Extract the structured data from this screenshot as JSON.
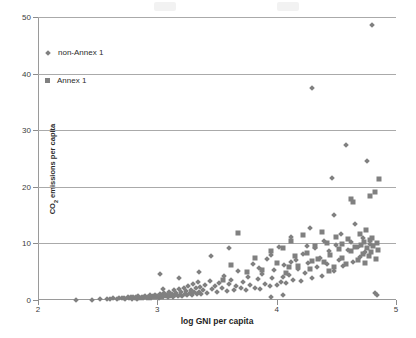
{
  "chart_data": {
    "type": "scatter",
    "title": "",
    "xlabel": "log GNI per capita",
    "ylabel": "CO₂ emissions per capita",
    "xlim": [
      2,
      5
    ],
    "ylim": [
      0,
      50
    ],
    "xticks": [
      "2",
      "3",
      "4",
      "5"
    ],
    "xtick_values": [
      2,
      3,
      4,
      5
    ],
    "yticks": [
      "0",
      "10",
      "20",
      "30",
      "40",
      "50"
    ],
    "ytick_values": [
      0,
      10,
      20,
      30,
      40,
      50
    ],
    "grid": "horizontal",
    "legend_position": "upper-left-inside",
    "marker_color": "#808080",
    "grid_color": "#aaaaaa",
    "axis_color": "#9a9a9a",
    "legend": [
      {
        "label": "non-Annex 1",
        "marker": "diamond"
      },
      {
        "label": "Annex 1",
        "marker": "square"
      }
    ],
    "series": [
      {
        "name": "non-Annex 1",
        "marker": "diamond",
        "points": [
          [
            2.32,
            0.05
          ],
          [
            2.45,
            0.06
          ],
          [
            2.52,
            0.1
          ],
          [
            2.58,
            0.22
          ],
          [
            2.6,
            0.15
          ],
          [
            2.63,
            0.3
          ],
          [
            2.66,
            0.2
          ],
          [
            2.68,
            0.35
          ],
          [
            2.7,
            0.28
          ],
          [
            2.72,
            0.42
          ],
          [
            2.73,
            0.18
          ],
          [
            2.75,
            0.55
          ],
          [
            2.76,
            0.3
          ],
          [
            2.78,
            0.45
          ],
          [
            2.79,
            0.25
          ],
          [
            2.8,
            0.6
          ],
          [
            2.81,
            0.38
          ],
          [
            2.82,
            0.5
          ],
          [
            2.83,
            0.22
          ],
          [
            2.84,
            0.7
          ],
          [
            2.85,
            0.4
          ],
          [
            2.86,
            0.33
          ],
          [
            2.87,
            0.58
          ],
          [
            2.88,
            0.28
          ],
          [
            2.89,
            0.48
          ],
          [
            2.9,
            0.65
          ],
          [
            2.91,
            0.35
          ],
          [
            2.92,
            0.55
          ],
          [
            2.93,
            0.42
          ],
          [
            2.94,
            0.8
          ],
          [
            2.95,
            0.3
          ],
          [
            2.96,
            0.62
          ],
          [
            2.97,
            0.45
          ],
          [
            2.98,
            0.95
          ],
          [
            2.99,
            0.5
          ],
          [
            3.0,
            0.7
          ],
          [
            3.01,
            0.38
          ],
          [
            3.02,
            1.1
          ],
          [
            3.03,
            0.55
          ],
          [
            3.04,
            0.85
          ],
          [
            3.05,
            0.45
          ],
          [
            3.06,
            1.3
          ],
          [
            3.07,
            0.62
          ],
          [
            3.08,
            0.9
          ],
          [
            3.02,
            4.6
          ],
          [
            3.05,
            2.0
          ],
          [
            3.09,
            0.5
          ],
          [
            3.1,
            1.5
          ],
          [
            3.11,
            0.72
          ],
          [
            3.12,
            1.05
          ],
          [
            3.13,
            0.58
          ],
          [
            3.14,
            1.7
          ],
          [
            3.15,
            0.88
          ],
          [
            3.16,
            1.2
          ],
          [
            3.17,
            0.65
          ],
          [
            3.18,
            1.95
          ],
          [
            3.19,
            0.95
          ],
          [
            3.2,
            1.4
          ],
          [
            3.21,
            0.75
          ],
          [
            3.22,
            2.2
          ],
          [
            3.23,
            1.1
          ],
          [
            3.24,
            1.6
          ],
          [
            3.25,
            0.82
          ],
          [
            3.26,
            2.5
          ],
          [
            3.27,
            1.25
          ],
          [
            3.28,
            1.8
          ],
          [
            3.29,
            0.9
          ],
          [
            3.3,
            2.8
          ],
          [
            3.31,
            1.35
          ],
          [
            3.32,
            2.05
          ],
          [
            3.33,
            1.0
          ],
          [
            3.34,
            3.1
          ],
          [
            3.35,
            1.5
          ],
          [
            3.36,
            2.3
          ],
          [
            3.37,
            1.12
          ],
          [
            3.38,
            1.85
          ],
          [
            3.4,
            2.6
          ],
          [
            3.42,
            1.28
          ],
          [
            3.44,
            3.4
          ],
          [
            3.46,
            1.95
          ],
          [
            3.48,
            2.45
          ],
          [
            3.5,
            1.4
          ],
          [
            3.52,
            3.0
          ],
          [
            3.54,
            2.1
          ],
          [
            3.56,
            4.2
          ],
          [
            3.58,
            1.6
          ],
          [
            3.6,
            2.75
          ],
          [
            3.62,
            3.55
          ],
          [
            3.64,
            1.8
          ],
          [
            3.66,
            2.4
          ],
          [
            3.68,
            5.1
          ],
          [
            3.7,
            2.05
          ],
          [
            3.72,
            3.25
          ],
          [
            3.74,
            1.7
          ],
          [
            3.76,
            4.0
          ],
          [
            3.78,
            2.6
          ],
          [
            3.8,
            6.4
          ],
          [
            3.82,
            2.2
          ],
          [
            3.84,
            3.7
          ],
          [
            3.86,
            1.95
          ],
          [
            3.88,
            4.6
          ],
          [
            3.9,
            2.85
          ],
          [
            3.92,
            7.3
          ],
          [
            3.94,
            2.4
          ],
          [
            3.96,
            3.95
          ],
          [
            3.98,
            5.3
          ],
          [
            4.0,
            2.65
          ],
          [
            4.02,
            9.4
          ],
          [
            4.04,
            3.2
          ],
          [
            4.06,
            6.1
          ],
          [
            4.08,
            2.95
          ],
          [
            4.1,
            4.4
          ],
          [
            4.12,
            11.2
          ],
          [
            4.14,
            3.6
          ],
          [
            4.16,
            7.0
          ],
          [
            4.18,
            5.5
          ],
          [
            4.2,
            3.3
          ],
          [
            4.22,
            8.2
          ],
          [
            4.24,
            4.8
          ],
          [
            4.26,
            6.6
          ],
          [
            4.28,
            12.8
          ],
          [
            4.3,
            3.9
          ],
          [
            4.32,
            9.1
          ],
          [
            4.34,
            5.9
          ],
          [
            4.36,
            7.5
          ],
          [
            4.38,
            4.3
          ],
          [
            4.4,
            10.4
          ],
          [
            4.42,
            6.3
          ],
          [
            4.44,
            8.6
          ],
          [
            4.46,
            21.5
          ],
          [
            4.48,
            5.2
          ],
          [
            4.5,
            9.7
          ],
          [
            4.52,
            7.1
          ],
          [
            4.54,
            11.6
          ],
          [
            4.56,
            6.0
          ],
          [
            4.58,
            27.3
          ],
          [
            4.6,
            8.9
          ],
          [
            4.62,
            10.2
          ],
          [
            4.64,
            6.8
          ],
          [
            4.66,
            13.5
          ],
          [
            4.68,
            9.3
          ],
          [
            4.7,
            7.6
          ],
          [
            4.72,
            11.0
          ],
          [
            4.74,
            8.4
          ],
          [
            4.76,
            24.6
          ],
          [
            4.78,
            9.9
          ],
          [
            4.8,
            48.6
          ],
          [
            4.3,
            37.4
          ],
          [
            4.25,
            9.5
          ],
          [
            4.12,
            6.7
          ],
          [
            4.05,
            4.1
          ],
          [
            3.95,
            8.0
          ],
          [
            3.85,
            5.6
          ],
          [
            3.6,
            9.2
          ],
          [
            3.45,
            7.8
          ],
          [
            3.35,
            5.0
          ],
          [
            3.18,
            3.8
          ],
          [
            3.95,
            0.6
          ],
          [
            4.05,
            0.9
          ],
          [
            4.48,
            15.1
          ],
          [
            4.82,
            1.2
          ],
          [
            4.84,
            0.8
          ]
        ]
      },
      {
        "name": "Annex 1",
        "marker": "square",
        "points": [
          [
            3.62,
            6.2
          ],
          [
            3.68,
            11.8
          ],
          [
            3.82,
            7.4
          ],
          [
            3.88,
            5.3
          ],
          [
            3.95,
            8.6
          ],
          [
            4.0,
            6.5
          ],
          [
            4.05,
            9.2
          ],
          [
            4.08,
            4.7
          ],
          [
            4.12,
            10.5
          ],
          [
            4.15,
            7.8
          ],
          [
            4.18,
            6.0
          ],
          [
            4.22,
            11.4
          ],
          [
            4.25,
            8.3
          ],
          [
            4.28,
            5.5
          ],
          [
            4.32,
            9.6
          ],
          [
            4.35,
            7.2
          ],
          [
            4.38,
            12.1
          ],
          [
            4.4,
            6.8
          ],
          [
            4.42,
            10.0
          ],
          [
            4.45,
            8.0
          ],
          [
            4.48,
            5.9
          ],
          [
            4.5,
            11.2
          ],
          [
            4.52,
            9.0
          ],
          [
            4.55,
            7.5
          ],
          [
            4.58,
            6.4
          ],
          [
            4.6,
            10.8
          ],
          [
            4.62,
            8.7
          ],
          [
            4.64,
            17.4
          ],
          [
            4.66,
            9.4
          ],
          [
            4.68,
            7.0
          ],
          [
            4.7,
            11.6
          ],
          [
            4.71,
            9.8
          ],
          [
            4.72,
            8.2
          ],
          [
            4.73,
            10.3
          ],
          [
            4.74,
            6.6
          ],
          [
            4.75,
            12.4
          ],
          [
            4.76,
            9.1
          ],
          [
            4.77,
            7.7
          ],
          [
            4.78,
            10.6
          ],
          [
            4.79,
            8.5
          ],
          [
            4.8,
            11.0
          ],
          [
            4.81,
            9.6
          ],
          [
            4.82,
            19.1
          ],
          [
            4.83,
            7.3
          ],
          [
            4.84,
            10.1
          ],
          [
            4.85,
            8.8
          ],
          [
            4.86,
            21.4
          ],
          [
            4.78,
            18.3
          ],
          [
            4.62,
            17.9
          ],
          [
            4.55,
            9.9
          ],
          [
            4.44,
            5.1
          ],
          [
            4.3,
            6.9
          ],
          [
            4.1,
            5.8
          ],
          [
            3.75,
            4.9
          ],
          [
            3.55,
            3.6
          ]
        ]
      }
    ]
  }
}
